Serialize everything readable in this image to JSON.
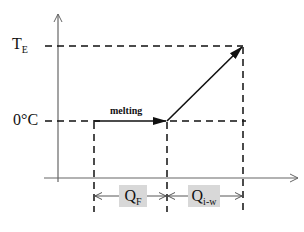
{
  "diagram": {
    "y_labels": {
      "top": {
        "main": "T",
        "sub": "E"
      },
      "bottom": "0°C"
    },
    "process_label": "melting",
    "intervals": [
      {
        "main": "Q",
        "sub": "F"
      },
      {
        "main": "Q",
        "sub": "i-w"
      }
    ],
    "colors": {
      "line": "#111111",
      "axis": "#666666",
      "label_box": "#d8d8d8"
    }
  }
}
